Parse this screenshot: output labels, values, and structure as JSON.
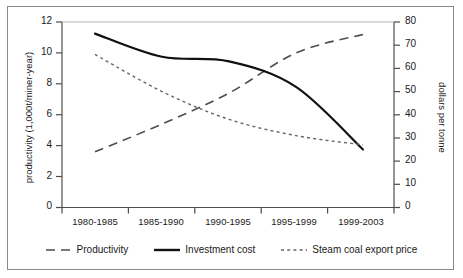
{
  "chart_data": {
    "type": "line",
    "title": "",
    "xlabel": "",
    "categories": [
      "1980-1985",
      "1985-1990",
      "1990-1995",
      "1995-1999",
      "1999-2003"
    ],
    "grid": false,
    "legend_position": "bottom",
    "axes": {
      "left": {
        "label": "productivity (1,000t/miner-year)",
        "ticks": [
          0,
          2,
          4,
          6,
          8,
          10,
          12
        ],
        "ylim": [
          0,
          12
        ]
      },
      "right": {
        "label": "dollars per tonne",
        "ticks": [
          0,
          10,
          20,
          30,
          40,
          50,
          60,
          70,
          80
        ],
        "ylim": [
          0,
          80
        ]
      }
    },
    "series": [
      {
        "name": "Productivity",
        "axis": "left",
        "style": "dashed",
        "color": "#4d4d4d",
        "values": [
          3.6,
          5.4,
          7.4,
          10.0,
          11.2
        ]
      },
      {
        "name": "Investment cost",
        "axis": "right",
        "style": "solid",
        "color": "#111111",
        "values": [
          75,
          65,
          63,
          52,
          25
        ]
      },
      {
        "name": "Steam coal export price",
        "axis": "right",
        "style": "dotted",
        "color": "#666666",
        "values": [
          66,
          50,
          38,
          31,
          27
        ]
      }
    ]
  },
  "legend": {
    "items": [
      {
        "label": "Productivity"
      },
      {
        "label": "Investment cost"
      },
      {
        "label": "Steam coal export price"
      }
    ]
  }
}
